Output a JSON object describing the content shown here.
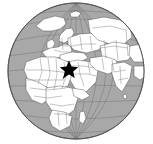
{
  "figure": {
    "kind": "orthographic-globe-locator-map",
    "background_color": "#ffffff",
    "width": 153,
    "height": 144,
    "alt_text": "Orthographic globe centered on Africa, Europe and the Middle East with a black star marking a location in the Middle East"
  },
  "globe": {
    "projection": "orthographic",
    "center_x": 76,
    "center_y": 71,
    "radius": 68,
    "ocean_color": "#a8a8a8",
    "land_color": "#ffffff",
    "coastline_color": "#4a4a4a",
    "border_color": "#6b6b6b",
    "graticule_color": "#6e6e6e",
    "outline_color": "#555555",
    "graticule_spacing_degrees": 15,
    "view_center_lon": 20,
    "view_center_lat": 25
  },
  "marker": {
    "symbol": "star",
    "name": "location-star",
    "color": "#000000",
    "x": 69,
    "y": 69,
    "size": 17,
    "points": 5,
    "region_label": "Middle East"
  },
  "landmasses": [
    "Africa",
    "Europe",
    "Asia",
    "Arabian Peninsula",
    "India",
    "Greenland",
    "Madagascar",
    "Scandinavia",
    "British Isles",
    "Sri Lanka"
  ]
}
